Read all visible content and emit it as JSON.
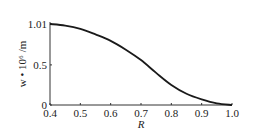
{
  "chart_data": {
    "type": "line",
    "title": "",
    "xlabel": "R",
    "ylabel": "w • 10⁶ /m",
    "xlim": [
      0.4,
      1.0
    ],
    "ylim": [
      0,
      1.01
    ],
    "x_ticks": [
      "0.4",
      "0.5",
      "0.6",
      "0.7",
      "0.8",
      "0.9",
      "1.0"
    ],
    "y_ticks": [
      "0",
      "0.5",
      "1.01"
    ],
    "grid": false,
    "legend": null,
    "series": [
      {
        "name": "w",
        "x": [
          0.4,
          0.45,
          0.5,
          0.55,
          0.6,
          0.65,
          0.7,
          0.75,
          0.8,
          0.85,
          0.9,
          0.95,
          1.0
        ],
        "values": [
          1.01,
          0.99,
          0.95,
          0.88,
          0.8,
          0.69,
          0.56,
          0.4,
          0.25,
          0.14,
          0.07,
          0.02,
          0.0
        ]
      }
    ]
  }
}
